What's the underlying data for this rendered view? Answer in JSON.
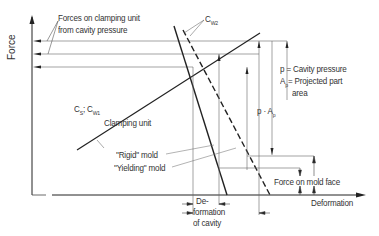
{
  "diagram": {
    "axes": {
      "y_label": "Force",
      "x_label": "Deformation"
    },
    "labels": {
      "forces_clamping_line1": "Forces on clamping unit",
      "forces_clamping_line2": "from cavity pressure",
      "cw2": "C",
      "cw2_sub": "W2",
      "cs": "C",
      "cs_sub": "S",
      "cs_sep": "; C",
      "cw1_sub": "W1",
      "clamping_unit": "Clamping unit",
      "rigid_mold": "\"Rigid\" mold",
      "yielding_mold": "\"Yielding\" mold",
      "p_def": "p = Cavity pressure",
      "ap_def_a": "A",
      "ap_def_sub": "p",
      "ap_def_rest": "= Projected part",
      "ap_def_line2": "area",
      "p_ap": "p · A",
      "p_ap_sub": "p",
      "force_on_mold_face": "Force on mold face",
      "deformation_cavity_line1": "De-",
      "deformation_cavity_line2": "formation",
      "deformation_cavity_line3": "of cavity"
    },
    "colors": {
      "line": "#222222",
      "thin": "#555555",
      "text": "#333333"
    }
  }
}
